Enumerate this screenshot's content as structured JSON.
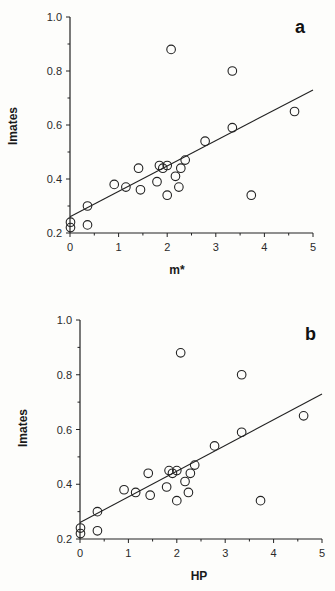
{
  "chart_data": [
    {
      "panel_label": "a",
      "type": "scatter",
      "title": "",
      "xlabel": "m*",
      "ylabel": "Imates",
      "xlim": [
        0,
        5
      ],
      "ylim": [
        0.2,
        1.0
      ],
      "x_ticks": [
        "0",
        "1",
        "2",
        "3",
        "4",
        "5"
      ],
      "y_ticks": [
        "0.2",
        "0.4",
        "0.6",
        "0.8",
        "1.0"
      ],
      "grid": false,
      "legend": null,
      "points": [
        {
          "x": 0.01,
          "y": 0.24
        },
        {
          "x": 0.01,
          "y": 0.22
        },
        {
          "x": 0.36,
          "y": 0.3
        },
        {
          "x": 0.36,
          "y": 0.23
        },
        {
          "x": 0.91,
          "y": 0.38
        },
        {
          "x": 1.15,
          "y": 0.37
        },
        {
          "x": 1.41,
          "y": 0.44
        },
        {
          "x": 1.45,
          "y": 0.36
        },
        {
          "x": 1.79,
          "y": 0.39
        },
        {
          "x": 1.84,
          "y": 0.45
        },
        {
          "x": 1.91,
          "y": 0.44
        },
        {
          "x": 2.0,
          "y": 0.45
        },
        {
          "x": 2.0,
          "y": 0.34
        },
        {
          "x": 2.08,
          "y": 0.88
        },
        {
          "x": 2.17,
          "y": 0.41
        },
        {
          "x": 2.24,
          "y": 0.37
        },
        {
          "x": 2.28,
          "y": 0.44
        },
        {
          "x": 2.37,
          "y": 0.47
        },
        {
          "x": 2.78,
          "y": 0.54
        },
        {
          "x": 3.34,
          "y": 0.8
        },
        {
          "x": 3.34,
          "y": 0.59
        },
        {
          "x": 3.73,
          "y": 0.34
        },
        {
          "x": 4.62,
          "y": 0.65
        }
      ],
      "regression_line": {
        "x0": 0,
        "y0": 0.26,
        "x1": 5,
        "y1": 0.73
      }
    },
    {
      "panel_label": "b",
      "type": "scatter",
      "title": "",
      "xlabel": "HP",
      "ylabel": "Imates",
      "xlim": [
        0,
        5
      ],
      "ylim": [
        0.2,
        1.0
      ],
      "x_ticks": [
        "0",
        "1",
        "2",
        "3",
        "4",
        "5"
      ],
      "y_ticks": [
        "0.2",
        "0.4",
        "0.6",
        "0.8",
        "1.0"
      ],
      "grid": false,
      "legend": null,
      "points": [
        {
          "x": 0.01,
          "y": 0.24
        },
        {
          "x": 0.01,
          "y": 0.22
        },
        {
          "x": 0.36,
          "y": 0.3
        },
        {
          "x": 0.36,
          "y": 0.23
        },
        {
          "x": 0.91,
          "y": 0.38
        },
        {
          "x": 1.15,
          "y": 0.37
        },
        {
          "x": 1.41,
          "y": 0.44
        },
        {
          "x": 1.45,
          "y": 0.36
        },
        {
          "x": 1.79,
          "y": 0.39
        },
        {
          "x": 1.84,
          "y": 0.45
        },
        {
          "x": 1.91,
          "y": 0.44
        },
        {
          "x": 2.0,
          "y": 0.45
        },
        {
          "x": 2.0,
          "y": 0.34
        },
        {
          "x": 2.08,
          "y": 0.88
        },
        {
          "x": 2.17,
          "y": 0.41
        },
        {
          "x": 2.24,
          "y": 0.37
        },
        {
          "x": 2.28,
          "y": 0.44
        },
        {
          "x": 2.37,
          "y": 0.47
        },
        {
          "x": 2.78,
          "y": 0.54
        },
        {
          "x": 3.34,
          "y": 0.8
        },
        {
          "x": 3.34,
          "y": 0.59
        },
        {
          "x": 3.73,
          "y": 0.34
        },
        {
          "x": 4.62,
          "y": 0.65
        }
      ],
      "regression_line": {
        "x0": 0,
        "y0": 0.26,
        "x1": 5,
        "y1": 0.73
      }
    }
  ],
  "panels": {
    "a": {
      "label": "a",
      "xlabel": "m*",
      "ylabel": "Imates"
    },
    "b": {
      "label": "b",
      "xlabel": "HP",
      "ylabel": "Imates"
    }
  },
  "colors": {
    "background": "#fdfdfb",
    "ink": "#222222"
  }
}
